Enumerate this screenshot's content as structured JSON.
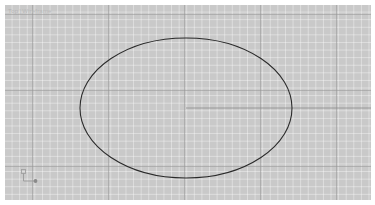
{
  "window": {
    "background_color": "#ffffff"
  },
  "viewport": {
    "label_view": "Top",
    "label_separator": "]",
    "label_mode": "Wireframe",
    "background_color": "#c9c9c9",
    "grid": {
      "minor_color": "#ffffff",
      "major_color": "#969696",
      "minor_spacing_px": 7.6,
      "major_spacing_px": 76,
      "visible": true
    }
  },
  "origin_marker": {
    "name": "world-coordinate-axes",
    "axis_color": "#9a9a9a",
    "origin_dot_color": "#8a8a8a"
  },
  "geometry": {
    "stroke_color": "#2a2a2a",
    "stroke_width": 1.1,
    "shapes": [
      {
        "name": "ellipse-outline",
        "type": "ellipse",
        "cx": 181,
        "cy": 103,
        "rx": 106,
        "ry": 70
      },
      {
        "name": "construction-line-horizontal",
        "type": "line",
        "x1": 181,
        "y1": 103,
        "x2": 366,
        "y2": 103,
        "stroke_color": "#8c8c8c",
        "stroke_width": 0.8
      }
    ]
  },
  "chart_data": {
    "type": "scatter",
    "title": "",
    "xlabel": "",
    "ylabel": "",
    "grid": true,
    "legend": "none"
  }
}
